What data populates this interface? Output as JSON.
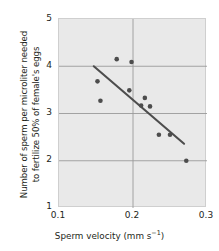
{
  "chart_data": {
    "type": "scatter",
    "title": "",
    "xlabel_main": "Sperm velocity (mm s",
    "xlabel_exp": "−1",
    "xlabel_tail": ")",
    "xlabel_full": "Sperm velocity (mm s−1)",
    "ylabel_line1": "Number of sperm per microliter needed",
    "ylabel_line2": "to fertilize 50% of female's eggs",
    "xlim": [
      0.1,
      0.3
    ],
    "ylim": [
      1,
      5
    ],
    "xticks": [
      "0.1",
      "0.2",
      "0.3"
    ],
    "xtick_values": [
      0.1,
      0.2,
      0.3
    ],
    "yticks": [
      "1",
      "2",
      "3",
      "4",
      "5"
    ],
    "ytick_values": [
      1,
      2,
      3,
      4,
      5
    ],
    "grid": true,
    "legend": "none",
    "plot_bgcolor": "#e9e9e9",
    "grid_color": "#9a9a9a",
    "marker_color": "#4d4d4d",
    "line_color": "#4d4d4d",
    "points": [
      {
        "x": 0.152,
        "y": 3.68
      },
      {
        "x": 0.156,
        "y": 3.27
      },
      {
        "x": 0.178,
        "y": 4.15
      },
      {
        "x": 0.198,
        "y": 4.09
      },
      {
        "x": 0.195,
        "y": 3.49
      },
      {
        "x": 0.216,
        "y": 3.33
      },
      {
        "x": 0.211,
        "y": 3.17
      },
      {
        "x": 0.223,
        "y": 3.15
      },
      {
        "x": 0.235,
        "y": 2.55
      },
      {
        "x": 0.25,
        "y": 2.55
      },
      {
        "x": 0.272,
        "y": 2.0
      }
    ],
    "trendline": {
      "x1": 0.147,
      "y1": 4.0,
      "x2": 0.269,
      "y2": 2.36
    }
  }
}
